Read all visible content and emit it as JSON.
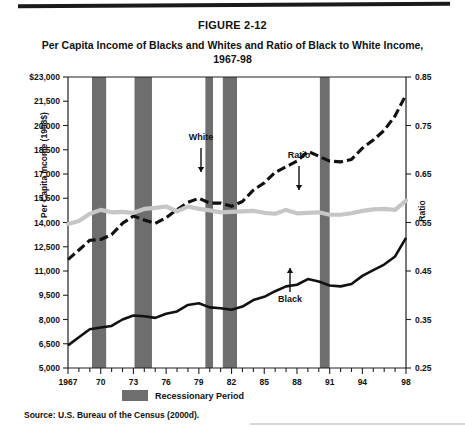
{
  "figure": {
    "number": "FIGURE 2-12",
    "title_line1": "Per Capita Income of Blacks and Whites and Ratio of Black to White Income,",
    "title_line2": "1967-98",
    "source": "Source: U.S. Bureau of the Census (2000d)."
  },
  "legend": {
    "recession_label": "Recessionary Period",
    "recession_color": "#6e6e6e"
  },
  "annotations": [
    {
      "name": "white-series-label",
      "text": "White"
    },
    {
      "name": "ratio-series-label",
      "text": "Ratio"
    },
    {
      "name": "black-series-label",
      "text": "Black"
    }
  ],
  "chart_data": {
    "type": "line",
    "title": "Per Capita Income of Blacks and Whites and Ratio of Black to White Income, 1967-98",
    "xlabel": "",
    "ylabel": "Per Capita Income (1998$)",
    "ylabel_right": "Ratio",
    "xlim": [
      1967,
      1998
    ],
    "ylim": [
      5000,
      23000
    ],
    "ylim_right": [
      0.25,
      0.85
    ],
    "grid": false,
    "legend_position": "bottom-left",
    "x": [
      1967,
      1968,
      1969,
      1970,
      1971,
      1972,
      1973,
      1974,
      1975,
      1976,
      1977,
      1978,
      1979,
      1980,
      1981,
      1982,
      1983,
      1984,
      1985,
      1986,
      1987,
      1988,
      1989,
      1990,
      1991,
      1992,
      1993,
      1994,
      1995,
      1996,
      1997,
      1998
    ],
    "xtick_labels": [
      "1967",
      "70",
      "73",
      "76",
      "79",
      "82",
      "85",
      "88",
      "91",
      "94",
      "98"
    ],
    "xtick_values": [
      1967,
      1970,
      1973,
      1976,
      1979,
      1982,
      1985,
      1988,
      1991,
      1994,
      1998
    ],
    "ytick_labels_left": [
      "$23,000",
      "21,500",
      "20,000",
      "18,500",
      "17,000",
      "15,500",
      "14,000",
      "12,500",
      "11,000",
      "9,500",
      "8,000",
      "6,500",
      "5,000"
    ],
    "ytick_values_left": [
      23000,
      21500,
      20000,
      18500,
      17000,
      15500,
      14000,
      12500,
      11000,
      9500,
      8000,
      6500,
      5000
    ],
    "ytick_labels_right": [
      "0.85",
      "0.75",
      "0.65",
      "0.55",
      "0.45",
      "0.35",
      "0.25"
    ],
    "ytick_values_right": [
      0.85,
      0.75,
      0.65,
      0.55,
      0.45,
      0.35,
      0.25
    ],
    "series": [
      {
        "name": "White",
        "axis": "left",
        "style": "dashed",
        "color": "#111111",
        "values": [
          11700,
          12300,
          12900,
          12950,
          13250,
          13950,
          14400,
          14150,
          13950,
          14300,
          14800,
          15250,
          15500,
          15200,
          15200,
          15000,
          15300,
          16000,
          16450,
          17100,
          17450,
          17800,
          18400,
          18100,
          17800,
          17750,
          17900,
          18600,
          19100,
          19700,
          20600,
          21900
        ]
      },
      {
        "name": "Black",
        "axis": "left",
        "style": "solid",
        "color": "#111111",
        "values": [
          6400,
          6900,
          7400,
          7500,
          7600,
          8000,
          8250,
          8200,
          8100,
          8350,
          8500,
          8900,
          9000,
          8750,
          8700,
          8600,
          8800,
          9200,
          9400,
          9750,
          10050,
          10150,
          10500,
          10350,
          10100,
          10050,
          10200,
          10700,
          11050,
          11400,
          11900,
          13050
        ]
      },
      {
        "name": "Ratio",
        "axis": "right",
        "style": "solid-thick-gray",
        "color": "#c6c6c6",
        "values": [
          0.547,
          0.553,
          0.568,
          0.576,
          0.571,
          0.572,
          0.57,
          0.578,
          0.58,
          0.583,
          0.573,
          0.583,
          0.578,
          0.575,
          0.571,
          0.572,
          0.573,
          0.574,
          0.57,
          0.568,
          0.576,
          0.569,
          0.57,
          0.571,
          0.566,
          0.566,
          0.569,
          0.574,
          0.577,
          0.578,
          0.576,
          0.595
        ]
      }
    ],
    "recession_bands": [
      {
        "start": 1969.2,
        "end": 1970.5
      },
      {
        "start": 1973.1,
        "end": 1974.7
      },
      {
        "start": 1979.6,
        "end": 1980.3
      },
      {
        "start": 1981.2,
        "end": 1982.5
      },
      {
        "start": 1990.1,
        "end": 1991.0
      }
    ]
  }
}
